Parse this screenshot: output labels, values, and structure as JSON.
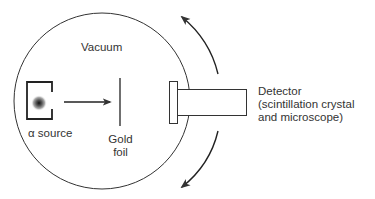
{
  "diagram": {
    "labels": {
      "vacuum": "Vacuum",
      "source": "α source",
      "foil_line1": "Gold",
      "foil_line2": "foil",
      "detector_line1": "Detector",
      "detector_line2": "(scintillation crystal",
      "detector_line3": "and microscope)"
    },
    "components": [
      {
        "id": "vacuum-chamber",
        "shape": "circle"
      },
      {
        "id": "alpha-source",
        "shape": "bracket-with-dot"
      },
      {
        "id": "alpha-beam",
        "shape": "arrow"
      },
      {
        "id": "gold-foil",
        "shape": "line"
      },
      {
        "id": "detector",
        "shape": "flanged-tube"
      },
      {
        "id": "rotation-arrows",
        "shape": "curved-arrows",
        "count": 2
      }
    ],
    "colors": {
      "stroke": "#333333",
      "background": "#ffffff"
    }
  }
}
